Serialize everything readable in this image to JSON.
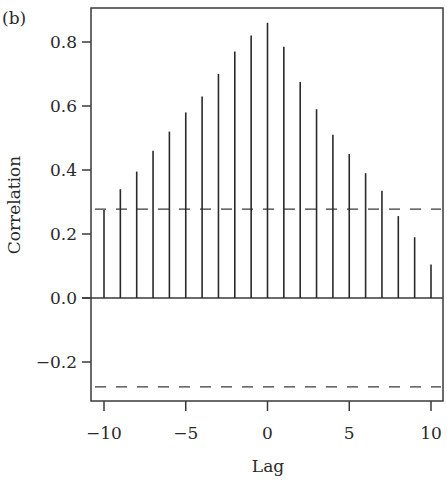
{
  "chart_data": {
    "type": "bar",
    "subtype": "cross-correlation stem plot",
    "panel_label": "(b)",
    "title": "",
    "xlabel": "Lag",
    "ylabel": "Correlation",
    "x": [
      -10,
      -9,
      -8,
      -7,
      -6,
      -5,
      -4,
      -3,
      -2,
      -1,
      0,
      1,
      2,
      3,
      4,
      5,
      6,
      7,
      8,
      9,
      10
    ],
    "values": [
      0.275,
      0.34,
      0.395,
      0.46,
      0.52,
      0.58,
      0.63,
      0.7,
      0.77,
      0.82,
      0.86,
      0.785,
      0.675,
      0.59,
      0.51,
      0.45,
      0.39,
      0.335,
      0.256,
      0.19,
      0.105
    ],
    "confidence_bounds": [
      0.278,
      -0.278
    ],
    "xlim": [
      -10.7,
      10.7
    ],
    "ylim": [
      -0.32,
      0.92
    ],
    "xticks": [
      -10,
      -5,
      0,
      5,
      10
    ],
    "xtick_labels": [
      "−10",
      "−5",
      "0",
      "5",
      "10"
    ],
    "yticks": [
      -0.2,
      0.0,
      0.2,
      0.4,
      0.6,
      0.8
    ],
    "ytick_labels": [
      "−0.2",
      "0.0",
      "0.2",
      "0.4",
      "0.6",
      "0.8"
    ],
    "grid": false,
    "legend": null,
    "zero_line": true,
    "colors": {
      "stem": "#2a2a2a",
      "axis": "#3a3a3a",
      "dashed": "#3a3a3a",
      "background": "#ffffff"
    }
  }
}
